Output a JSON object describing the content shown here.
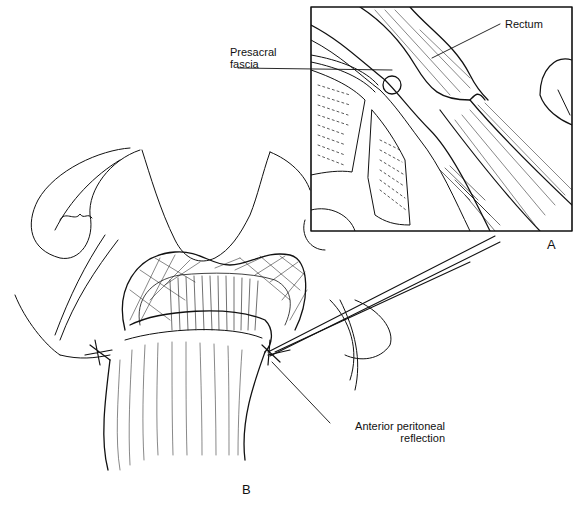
{
  "figure": {
    "panels": [
      {
        "id": "A",
        "label": "A",
        "description": "Inset: sagittal view of rectum and presacral fascia"
      },
      {
        "id": "B",
        "label": "B",
        "description": "Operative view of rectum with retractor"
      }
    ],
    "labels": {
      "rectum": "Rectum",
      "presacral_line1": "Presacral",
      "presacral_line2": "fascia",
      "anterior_line1": "Anterior peritoneal",
      "anterior_line2": "reflection"
    },
    "colors": {
      "ink": "#111111",
      "background": "#ffffff"
    }
  }
}
